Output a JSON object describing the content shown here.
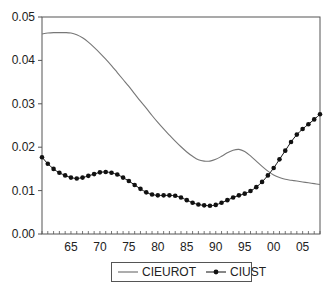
{
  "chart_data": {
    "type": "line",
    "title": "",
    "xlabel": "",
    "ylabel": "",
    "xlim": [
      1960,
      2008
    ],
    "ylim": [
      0.0,
      0.05
    ],
    "grid": false,
    "legend_position": "bottom",
    "x_tick_labels": [
      "65",
      "70",
      "75",
      "80",
      "85",
      "90",
      "95",
      "00",
      "05"
    ],
    "x_tick_values": [
      1965,
      1970,
      1975,
      1980,
      1985,
      1990,
      1995,
      2000,
      2005
    ],
    "y_tick_labels": [
      "0.00",
      "0.01",
      "0.02",
      "0.03",
      "0.04",
      "0.05"
    ],
    "y_tick_values": [
      0.0,
      0.01,
      0.02,
      0.03,
      0.04,
      0.05
    ],
    "x": [
      1960,
      1961,
      1962,
      1963,
      1964,
      1965,
      1966,
      1967,
      1968,
      1969,
      1970,
      1971,
      1972,
      1973,
      1974,
      1975,
      1976,
      1977,
      1978,
      1979,
      1980,
      1981,
      1982,
      1983,
      1984,
      1985,
      1986,
      1987,
      1988,
      1989,
      1990,
      1991,
      1992,
      1993,
      1994,
      1995,
      1996,
      1997,
      1998,
      1999,
      2000,
      2001,
      2002,
      2003,
      2004,
      2005,
      2006,
      2007,
      2008
    ],
    "series": [
      {
        "name": "CIEUROT",
        "style": "line",
        "color": "#777777",
        "values": [
          0.0461,
          0.0463,
          0.0464,
          0.0464,
          0.0464,
          0.0463,
          0.0459,
          0.0452,
          0.0442,
          0.043,
          0.0417,
          0.0403,
          0.0388,
          0.0372,
          0.0356,
          0.034,
          0.0323,
          0.0306,
          0.029,
          0.0273,
          0.0257,
          0.0242,
          0.0228,
          0.0214,
          0.0201,
          0.0189,
          0.0179,
          0.0171,
          0.0168,
          0.0168,
          0.0172,
          0.0179,
          0.0187,
          0.0193,
          0.0195,
          0.019,
          0.018,
          0.0168,
          0.0156,
          0.0145,
          0.0136,
          0.013,
          0.0126,
          0.0124,
          0.0122,
          0.012,
          0.0118,
          0.0116,
          0.0114
        ]
      },
      {
        "name": "CIUST",
        "style": "line-marker",
        "color": "#111111",
        "values": [
          0.0177,
          0.0162,
          0.015,
          0.0141,
          0.0135,
          0.013,
          0.0128,
          0.013,
          0.0134,
          0.0138,
          0.0142,
          0.0143,
          0.0141,
          0.0137,
          0.013,
          0.0122,
          0.0113,
          0.0104,
          0.0096,
          0.0091,
          0.0089,
          0.0089,
          0.0089,
          0.0088,
          0.0084,
          0.0078,
          0.0072,
          0.0068,
          0.0066,
          0.0065,
          0.0067,
          0.0072,
          0.0078,
          0.0084,
          0.0089,
          0.0093,
          0.0099,
          0.0108,
          0.012,
          0.0135,
          0.0152,
          0.0172,
          0.0192,
          0.0212,
          0.0229,
          0.0242,
          0.0253,
          0.0264,
          0.0276
        ]
      }
    ]
  },
  "legend": {
    "items": [
      {
        "label": "CIEUROT",
        "marker": "line"
      },
      {
        "label": "CIUST",
        "marker": "line-dot"
      }
    ]
  },
  "colors": {
    "axis": "#555555",
    "cieurot": "#777777",
    "ciust": "#111111"
  }
}
